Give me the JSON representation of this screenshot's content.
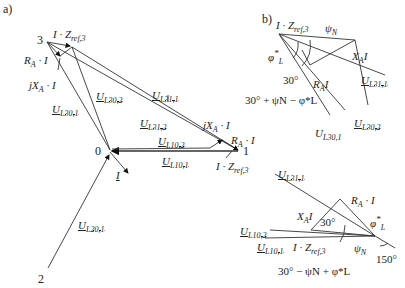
{
  "panels": {
    "a": "a)",
    "b": "b)"
  },
  "nodes": {
    "n0": "0",
    "n1": "1",
    "n2": "2",
    "n3": "3"
  },
  "labels_a": {
    "IZref3_top": {
      "main": "I · Z",
      "sub": "ref,3"
    },
    "RA_I": {
      "main": "R",
      "sub": "A",
      "tail": " · I"
    },
    "jXA_I": {
      "main": "jX",
      "sub": "A",
      "tail": " · I"
    },
    "UL30_1": {
      "main": "U",
      "sub": "L30,1"
    },
    "UL30_2": {
      "main": "U",
      "sub": "L30,2"
    },
    "UL31_1": {
      "main": "U",
      "sub": "L31,1"
    },
    "UL31_2": {
      "main": "U",
      "sub": "L31,2"
    },
    "UL10_2": {
      "main": "U",
      "sub": "L10,2"
    },
    "UL10_1": {
      "main": "U",
      "sub": "L10,1"
    },
    "jXA_I_right": {
      "main": "jX",
      "sub": "A",
      "tail": " · I"
    },
    "RA_I_right": {
      "main": "R",
      "sub": "A",
      "tail": " · I"
    },
    "IZref3_right": {
      "main": "I · Z",
      "sub": "ref,3"
    },
    "I_current": "I",
    "UL20_1": {
      "main": "U",
      "sub": "L20,1"
    }
  },
  "labels_b_top": {
    "IZref3": {
      "main": "I · Z",
      "sub": "ref,3"
    },
    "psiN": {
      "main": "ψ",
      "sub": "N"
    },
    "phiL": {
      "main": "φ",
      "sup": "*",
      "sub": "L"
    },
    "XA_I": {
      "main": "X",
      "sub": "A",
      "tail": "I"
    },
    "angle30": "30°",
    "RA_I": {
      "main": "R",
      "sub": "A",
      "tail": "I"
    },
    "UL31_1": {
      "main": "U",
      "sub": "L31,1"
    },
    "expr": "30° + ψN − φ*L",
    "UL30_2": {
      "main": "U",
      "sub": "L30,2"
    },
    "UL30_1": {
      "main": "U",
      "sub": "L30,1"
    }
  },
  "labels_b_bottom": {
    "UL31_1": {
      "main": "U",
      "sub": "L31,1"
    },
    "RA_I": {
      "main": "R",
      "sub": "A",
      "tail": " · I"
    },
    "XA_I": {
      "main": "X",
      "sub": "A",
      "tail": "I"
    },
    "angle30": "30°",
    "phiL": {
      "main": "φ",
      "sup": "*",
      "sub": "L"
    },
    "UL10_2": {
      "main": "U",
      "sub": "L10,2"
    },
    "UL10_1": {
      "main": "U",
      "sub": "L10,1"
    },
    "IZref3": {
      "main": "I · Z",
      "sub": "ref,3"
    },
    "psiN": {
      "main": "ψ",
      "sub": "N"
    },
    "angle150": "150°",
    "expr": "30° − ψN + φ*L"
  }
}
